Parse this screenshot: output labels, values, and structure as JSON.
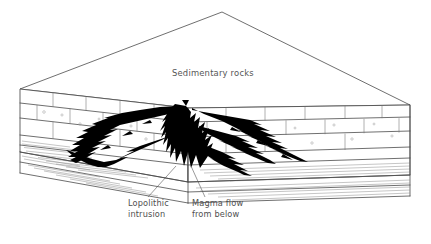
{
  "diagram": {
    "title_label": "Sedimentary rocks",
    "colors": {
      "background": "#ffffff",
      "outline": "#4a4a4a",
      "hatching": "#8d8d8d",
      "intrusion": "#000000",
      "text": "#4f4f4f"
    },
    "labels": [
      {
        "id": "sedimentary-rocks",
        "text": "Sedimentary rocks",
        "line1": "Sedimentary rocks",
        "line2": "",
        "x": 172,
        "y": 76
      },
      {
        "id": "lopolithic-intrusion",
        "line1": "Lopolithic",
        "line2": "intrusion",
        "x": 128,
        "y": 205
      },
      {
        "id": "magma-flow",
        "line1": "Magma flow",
        "line2": "from below",
        "x": 192,
        "y": 205
      }
    ],
    "geometry": {
      "top_back_apex": [
        222,
        12
      ],
      "top_left_corner": [
        20,
        89
      ],
      "top_right_corner": [
        410,
        105
      ],
      "top_front_corner": [
        188,
        108
      ],
      "block_bottom_left": [
        20,
        152
      ],
      "block_bottom_right": [
        410,
        175
      ],
      "block_bottom_front": [
        188,
        182
      ]
    },
    "strata": {
      "left_face_bands": 5,
      "right_face_bands": 5,
      "joint_columns_left": 5,
      "joint_columns_right": 6,
      "hatched_lower_layers": 3
    },
    "intrusion": {
      "shape": "funnel-shaped lopolith with jagged spiky arms",
      "arms_left": 3,
      "arms_right": 3,
      "feeder": "central vertical magma conduit from below"
    }
  }
}
